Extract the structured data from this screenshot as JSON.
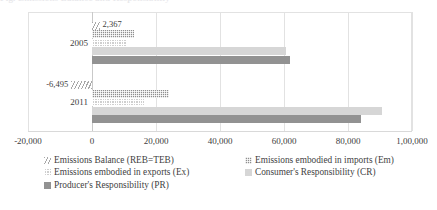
{
  "cut_caption": "Fig. Emissions Balance and Responsibility",
  "chart_data": {
    "type": "bar",
    "orientation": "horizontal",
    "title": "",
    "subtitle": "",
    "xlabel": "",
    "ylabel": "",
    "xlim": [
      -20000,
      100000
    ],
    "grid": true,
    "grid_axis": "x",
    "legend_position": "bottom",
    "categories": [
      "2005",
      "2011"
    ],
    "xtick_labels": [
      "-20,000",
      "0",
      "20,000",
      "40,000",
      "60,000",
      "80,000",
      "1,00,000"
    ],
    "xtick_values": [
      -20000,
      0,
      20000,
      40000,
      60000,
      80000,
      100000
    ],
    "series": [
      {
        "name": "Emissions Balance (REB=TEB)",
        "key": "reb",
        "pattern": "diagonal-hatch",
        "color": "#a8a8a8",
        "values": [
          2367,
          -6495
        ],
        "labels": [
          "2,367",
          "-6,495"
        ],
        "labels_shown": true
      },
      {
        "name": "Emissions embodied in imports (Em)",
        "key": "em",
        "pattern": "dark-checkerboard",
        "color": "#8e8e8e",
        "values": [
          13000,
          24200
        ],
        "labels": [
          "",
          ""
        ],
        "labels_shown": false
      },
      {
        "name": "Emissions embodied in exports (Ex)",
        "key": "ex",
        "pattern": "light-checkerboard",
        "color": "#cfcfcf",
        "values": [
          10600,
          16200
        ],
        "labels": [
          "",
          ""
        ],
        "labels_shown": false
      },
      {
        "name": "Consumer's Responsibility (CR)",
        "key": "cr",
        "pattern": "solid",
        "color": "#d6d6d6",
        "values": [
          60500,
          90500
        ],
        "labels": [
          "",
          ""
        ],
        "labels_shown": false
      },
      {
        "name": "Producer's Responsibility (PR)",
        "key": "pr",
        "pattern": "solid",
        "color": "#929292",
        "values": [
          62000,
          84000
        ],
        "labels": [
          "",
          ""
        ],
        "labels_shown": false
      }
    ],
    "legend_layout": {
      "left_column": [
        "Emissions Balance (REB=TEB)",
        "Emissions embodied in exports (Ex)",
        "Producer's Responsibility (PR)"
      ],
      "right_column": [
        "Emissions embodied in imports (Em)",
        "Consumer's Responsibility (CR)"
      ]
    }
  }
}
